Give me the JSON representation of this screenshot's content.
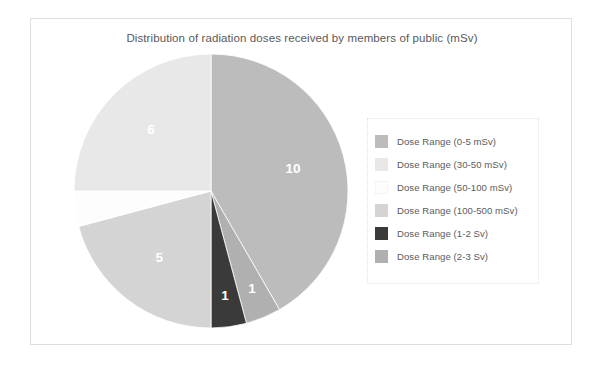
{
  "frame": {
    "border_color": "#dededd"
  },
  "chart_data": {
    "type": "pie",
    "title": "Distribution of radiation doses received by members of public (mSv)",
    "xlabel": "",
    "ylabel": "",
    "legend_position": "right",
    "grid": false,
    "total": 24,
    "categories": [
      "Dose Range (0-5 mSv)",
      "Dose Range (30-50 mSv)",
      "Dose Range (50-100 mSv)",
      "Dose Range (100-500 mSv)",
      "Dose Range (1-2 Sv)",
      "Dose Range (2-3 Sv)"
    ],
    "values": [
      10,
      6,
      1,
      5,
      1,
      1
    ],
    "colors": [
      "#bcbcbc",
      "#e8e8e8",
      "#fdfdfd",
      "#d4d4d4",
      "#3a3a3a",
      "#b0b0b0"
    ],
    "slices": [
      {
        "label": "Dose Range (0-5 mSv)",
        "value": 10,
        "data_label": "10",
        "color": "#bcbcbc",
        "label_visible": true
      },
      {
        "label": "Dose Range (2-3 Sv)",
        "value": 1,
        "data_label": "1",
        "color": "#b0b0b0",
        "label_visible": true
      },
      {
        "label": "Dose Range (1-2 Sv)",
        "value": 1,
        "data_label": "1",
        "color": "#3a3a3a",
        "label_visible": true
      },
      {
        "label": "Dose Range (100-500 mSv)",
        "value": 5,
        "data_label": "5",
        "color": "#d4d4d4",
        "label_visible": true
      },
      {
        "label": "Dose Range (50-100 mSv)",
        "value": 1,
        "data_label": "",
        "color": "#fdfdfd",
        "label_visible": false
      },
      {
        "label": "Dose Range (30-50 mSv)",
        "value": 6,
        "data_label": "6",
        "color": "#e8e8e8",
        "label_visible": true
      }
    ]
  },
  "pie": {
    "labels": {
      "slice_10": "10",
      "slice_2_3sv": "1",
      "slice_1_2sv": "1",
      "slice_5": "5",
      "slice_6": "6"
    }
  },
  "legend": {
    "items": [
      {
        "label": "Dose Range (0-5 mSv)",
        "color": "#bcbcbc"
      },
      {
        "label": "Dose Range (30-50 mSv)",
        "color": "#e8e8e8"
      },
      {
        "label": "Dose Range (50-100 mSv)",
        "color": "#fdfdfd"
      },
      {
        "label": "Dose Range (100-500 mSv)",
        "color": "#d4d4d4"
      },
      {
        "label": "Dose Range (1-2 Sv)",
        "color": "#3a3a3a"
      },
      {
        "label": "Dose Range (2-3 Sv)",
        "color": "#b0b0b0"
      }
    ]
  }
}
